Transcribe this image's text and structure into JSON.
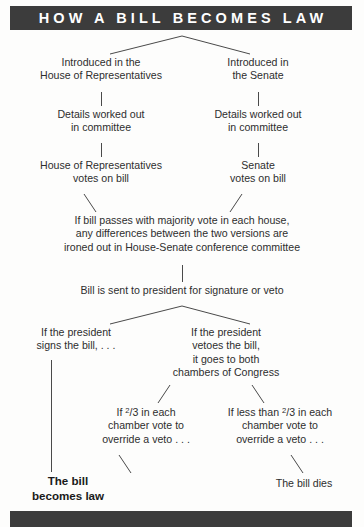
{
  "title_banner": {
    "text": "HOW A BILL BECOMES LAW",
    "background": "#3c3c3c",
    "text_color": "#ffffff"
  },
  "bottom_banner": {
    "background": "#3c3c3c"
  },
  "diagram": {
    "type": "flowchart",
    "line_color": "#4a4a4a",
    "text_color": "#2e2e2e",
    "background": "#fdfdfc",
    "nodes": [
      {
        "id": "introduced-house",
        "text": "Introduced in the\nHouse of Representatives",
        "bold": false
      },
      {
        "id": "introduced-senate",
        "text": "Introduced in\nthe Senate",
        "bold": false
      },
      {
        "id": "committee-house",
        "text": "Details worked out\nin committee",
        "bold": false
      },
      {
        "id": "committee-senate",
        "text": "Details worked out\nin committee",
        "bold": false
      },
      {
        "id": "vote-house",
        "text": "House of Representatives\nvotes on bill",
        "bold": false
      },
      {
        "id": "vote-senate",
        "text": "Senate\nvotes on bill",
        "bold": false
      },
      {
        "id": "conference-committee",
        "text": "If bill passes with majority vote in each house,\nany differences between the two versions are\nironed out in House-Senate conference committee",
        "bold": false
      },
      {
        "id": "sent-to-president",
        "text": "Bill is sent to president for signature or veto",
        "bold": false
      },
      {
        "id": "president-signs",
        "text": "If the president\nsigns the bill, . . .",
        "bold": false
      },
      {
        "id": "president-vetoes",
        "text": "If the president\nvetoes the bill,\nit goes to both\nchambers of Congress",
        "bold": false
      },
      {
        "id": "override-success",
        "text_before_fraction": "If ",
        "fraction_numerator": "2",
        "fraction_denominator": "3",
        "text_after_fraction": " in each\nchamber vote to\noverride a veto . . .",
        "bold": false
      },
      {
        "id": "override-fail",
        "text_before_fraction": "If less than ",
        "fraction_numerator": "2",
        "fraction_denominator": "3",
        "text_after_fraction": " in each\nchamber vote to\noverride a veto . . .",
        "bold": false
      },
      {
        "id": "becomes-law",
        "text": "The bill\nbecomes law",
        "bold": true
      },
      {
        "id": "bill-dies",
        "text": "The bill dies",
        "bold": false
      }
    ]
  }
}
